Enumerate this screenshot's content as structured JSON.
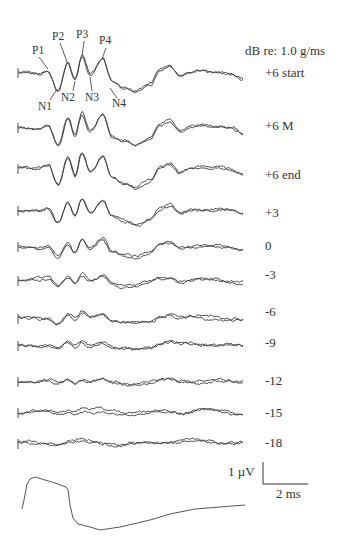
{
  "chart_data": {
    "type": "line",
    "title": "",
    "units_label": "dB re: 1.0 g/ms",
    "xlabel": "time (scale bar 2 ms)",
    "ylabel": "amplitude (scale bar 1 µV)",
    "scale_bar": {
      "vertical": "1 µV",
      "horizontal": "2 ms"
    },
    "peak_labels": [
      "P1",
      "P2",
      "P3",
      "P4",
      "N1",
      "N2",
      "N3",
      "N4"
    ],
    "series": [
      {
        "name": "+6 start",
        "baseline_y": 72,
        "amp": 1.0
      },
      {
        "name": "+6 M",
        "baseline_y": 127,
        "amp": 1.0
      },
      {
        "name": "+6 end",
        "baseline_y": 168,
        "amp": 1.0
      },
      {
        "name": "+3",
        "baseline_y": 210,
        "amp": 0.75
      },
      {
        "name": "0",
        "baseline_y": 246,
        "amp": 0.55
      },
      {
        "name": "-3",
        "baseline_y": 280,
        "amp": 0.35
      },
      {
        "name": "-6",
        "baseline_y": 318,
        "amp": 0.3
      },
      {
        "name": "-9",
        "baseline_y": 345,
        "amp": 0.25
      },
      {
        "name": "-12",
        "baseline_y": 381,
        "amp": 0.15
      },
      {
        "name": "-15",
        "baseline_y": 412,
        "amp": 0.08
      },
      {
        "name": "-18",
        "baseline_y": 443,
        "amp": 0.05
      }
    ],
    "stimulus_waveform": {
      "points": [
        [
          22,
          509
        ],
        [
          24,
          500
        ],
        [
          27,
          484
        ],
        [
          30,
          479
        ],
        [
          35,
          477
        ],
        [
          45,
          480
        ],
        [
          55,
          483
        ],
        [
          66,
          487
        ],
        [
          68,
          490
        ],
        [
          70,
          505
        ],
        [
          73,
          518
        ],
        [
          78,
          524
        ],
        [
          90,
          527
        ],
        [
          100,
          530
        ],
        [
          120,
          527
        ],
        [
          150,
          520
        ],
        [
          170,
          514
        ],
        [
          195,
          509
        ],
        [
          220,
          507
        ],
        [
          245,
          505
        ]
      ]
    }
  },
  "legend": {
    "units": "dB re: 1.0 g/ms",
    "levels": [
      "+6 start",
      "+6 M",
      "+6 end",
      "+3",
      "0",
      "-3",
      "-6",
      "-9",
      "-12",
      "-15",
      "-18"
    ]
  },
  "peaks": {
    "P1": "P1",
    "P2": "P2",
    "P3": "P3",
    "P4": "P4",
    "N1": "N1",
    "N2": "N2",
    "N3": "N3",
    "N4": "N4"
  },
  "scale": {
    "v": "1 µV",
    "h": "2 ms"
  },
  "colors": {
    "trace": "#3a3a3a",
    "text": "#333333"
  }
}
